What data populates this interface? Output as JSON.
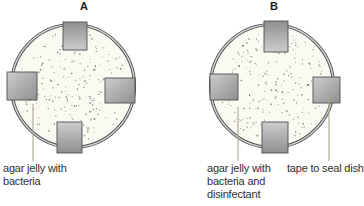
{
  "figure": {
    "dish_a": {
      "letter": "A",
      "caption_lines": [
        "agar jelly with",
        "bacteria"
      ]
    },
    "dish_b": {
      "letter": "B",
      "caption_lines": [
        "agar jelly with",
        "bacteria and",
        "disinfectant"
      ],
      "tape_caption": "tape to seal dish"
    }
  },
  "colors": {
    "background": "#ffffff",
    "dish-fill": "#fbfaf2",
    "rim-dark": "#4a4a4a",
    "rim-light": "#d0d0d0",
    "tape-light": "#cdcdcd",
    "tape-dark": "#8f8f8f",
    "tape-border": "#4f4f4f",
    "dot": "#676767",
    "leader": "#aaa695",
    "text": "#32312a"
  }
}
